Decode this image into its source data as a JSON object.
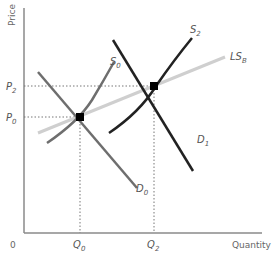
{
  "diagram": {
    "type": "supply-demand",
    "axes": {
      "y_label": "Price",
      "x_label": "Quantity",
      "origin_label": "0"
    },
    "price_levels": [
      {
        "label": "P",
        "sub": "2"
      },
      {
        "label": "P",
        "sub": "0"
      }
    ],
    "quantity_levels": [
      {
        "label": "Q",
        "sub": "0"
      },
      {
        "label": "Q",
        "sub": "2"
      }
    ],
    "curves": {
      "S0": {
        "label": "S",
        "sub": "0",
        "color": "#6e6e6e"
      },
      "D0": {
        "label": "D",
        "sub": "0",
        "color": "#6e6e6e"
      },
      "S2": {
        "label": "S",
        "sub": "2",
        "color": "#222222"
      },
      "D1": {
        "label": "D",
        "sub": "1",
        "color": "#222222"
      },
      "LSB": {
        "label": "LS",
        "sub": "B",
        "color": "#cfcfcf"
      }
    },
    "equilibria": [
      {
        "name": "initial",
        "price": "P0",
        "quantity": "Q0"
      },
      {
        "name": "new",
        "price": "P2",
        "quantity": "Q2"
      }
    ]
  }
}
